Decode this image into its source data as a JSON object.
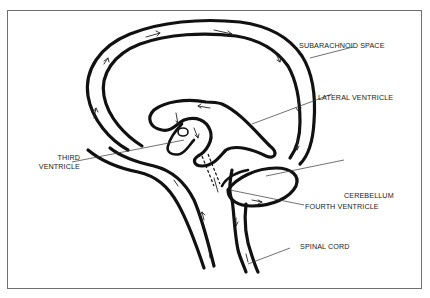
{
  "diagram": {
    "labels": {
      "subarachnoid_space": "SUBARACHNOID SPACE",
      "lateral_ventricle": "LATERAL VENTRICLE",
      "third_ventricle_line1": "THIRD",
      "third_ventricle_line2": "VENTRICLE",
      "cerebellum": "CEREBELLUM",
      "fourth_ventricle": "FOURTH VENTRICLE",
      "spinal_cord": "SPINAL CORD"
    },
    "colors": {
      "ink": "#111111",
      "frame": "#6f6f6f",
      "background": "#ffffff"
    }
  }
}
